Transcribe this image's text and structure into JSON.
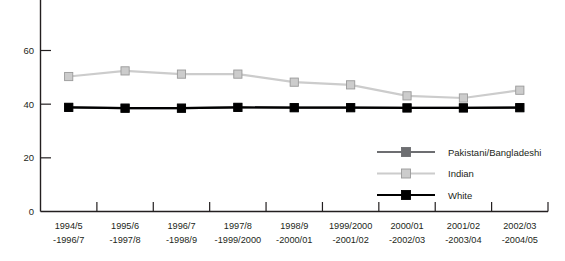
{
  "chart_data": {
    "type": "line",
    "title": "",
    "xlabel": "",
    "ylabel": "",
    "ylim": [
      0,
      70
    ],
    "yticks": [
      0,
      20,
      40,
      60
    ],
    "ytick_labels": [
      "0",
      "20",
      "40",
      "60"
    ],
    "grid": false,
    "legend_position": "center-right",
    "categories": [
      "1994/5\n-1996/7",
      "1995/6\n-1997/8",
      "1996/7\n-1998/9",
      "1997/8\n-1999/2000",
      "1998/9\n-2000/01",
      "1999/2000\n-2001/02",
      "2000/01\n-2002/03",
      "2001/02\n-2003/04",
      "2002/03\n-2004/05"
    ],
    "categories_lines": [
      [
        "1994/5",
        "-1996/7"
      ],
      [
        "1995/6",
        "-1997/8"
      ],
      [
        "1996/7",
        "-1998/9"
      ],
      [
        "1997/8",
        "-1999/2000"
      ],
      [
        "1998/9",
        "-2000/01"
      ],
      [
        "1999/2000",
        "-2001/02"
      ],
      [
        "2000/01",
        "-2002/03"
      ],
      [
        "2001/02",
        "-2003/04"
      ],
      [
        "2002/03",
        "-2004/05"
      ]
    ],
    "series": [
      {
        "name": "Pakistani/Bangladeshi",
        "color": "#6d6e71",
        "marker": "square",
        "values": [
          38.8,
          38.5,
          38.5,
          38.8,
          38.7,
          38.7,
          38.6,
          38.6,
          38.7
        ]
      },
      {
        "name": "Indian",
        "color": "#cccccc",
        "marker": "square",
        "values": [
          50.3,
          52.4,
          51.2,
          51.2,
          48.2,
          47.2,
          43.1,
          42.3,
          45.2
        ]
      },
      {
        "name": "White",
        "color": "#000000",
        "marker": "square",
        "values": [
          38.8,
          38.5,
          38.5,
          38.8,
          38.7,
          38.7,
          38.6,
          38.6,
          38.7
        ]
      }
    ]
  },
  "legend": {
    "items": [
      {
        "label": "Pakistani/Bangladeshi",
        "color": "#6d6e71"
      },
      {
        "label": "Indian",
        "color": "#cccccc"
      },
      {
        "label": "White",
        "color": "#000000"
      }
    ]
  },
  "axis": {
    "axis_color": "#231f20"
  }
}
